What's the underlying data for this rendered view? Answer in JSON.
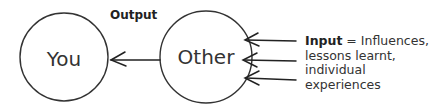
{
  "nodes": [
    {
      "id": "you",
      "label": "You",
      "cx": 64,
      "cy": 57,
      "r": 44
    },
    {
      "id": "other",
      "label": "Other",
      "cx": 206,
      "cy": 57,
      "r": 46
    }
  ],
  "output": {
    "label": "Output",
    "from": "other",
    "to": "you"
  },
  "input": {
    "term": "Input",
    "equals": " = ",
    "description_lines": [
      "Influences,",
      "lessons learnt,",
      "individual",
      "experiences"
    ],
    "arrow_count": 3,
    "target": "other"
  },
  "colors": {
    "stroke": "#333333",
    "text": "#333333",
    "background": "#ffffff"
  }
}
